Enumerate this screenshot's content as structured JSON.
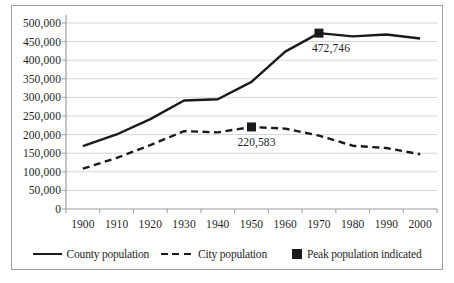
{
  "chart_data": {
    "type": "line",
    "title": "",
    "xlabel": "",
    "ylabel": "",
    "categories": [
      "1900",
      "1910",
      "1920",
      "1930",
      "1940",
      "1950",
      "1960",
      "1970",
      "1980",
      "1990",
      "2000"
    ],
    "series": [
      {
        "name": "County population",
        "style": "solid",
        "values": [
          168735,
          200298,
          241465,
          291606,
          295108,
          341719,
          423028,
          472746,
          463920,
          468973,
          458336
        ]
      },
      {
        "name": "City population",
        "style": "dashed",
        "values": [
          108374,
          137249,
          171717,
          209326,
          205967,
          220583,
          216038,
          197208,
          170105,
          163860,
          147306
        ]
      }
    ],
    "peak_markers": [
      {
        "series": 0,
        "category": "1970",
        "value": 472746,
        "label": "472,746"
      },
      {
        "series": 1,
        "category": "1950",
        "value": 220583,
        "label": "220,583"
      }
    ],
    "ylim": [
      0,
      500000
    ],
    "y_tick_step": 50000,
    "y_tick_labels": [
      "0",
      "50,000",
      "100,000",
      "150,000",
      "200,000",
      "250,000",
      "300,000",
      "350,000",
      "400,000",
      "450,000",
      "500,000"
    ],
    "grid": "horizontal",
    "legend": {
      "position": "bottom",
      "entries": [
        {
          "label": "County population",
          "symbol": "solid-line"
        },
        {
          "label": "City population",
          "symbol": "dashed-line"
        },
        {
          "label": "Peak population indicated",
          "symbol": "filled-square"
        }
      ]
    },
    "colors": {
      "line": "#1a1a1a",
      "marker": "#1a1a1a",
      "text": "#1f1f1f",
      "gridline": "#d6d6d6",
      "axis": "#9e9e9e",
      "frame_border": "#9e9e9e",
      "background": "#ffffff"
    }
  }
}
